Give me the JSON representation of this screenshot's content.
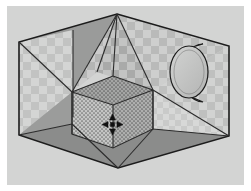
{
  "viewport": {
    "name": "3d-modeling-viewport",
    "canvas_background": "#d3d4d3",
    "page_background": "#ffffff",
    "outline_color": "#1c1c1c",
    "width": 251,
    "height": 191
  },
  "cursor": {
    "icon": "move-four-arrow-cursor",
    "x": 112,
    "y": 124,
    "color": "#111111"
  },
  "scene": {
    "label": "open-box-room-with-inner-cube-and-cylinder",
    "outer_shell": {
      "name": "outer-box-shell",
      "shape": "hexagonal-outline",
      "points": "117,14 229,46 229,136 118,168 19,135 19,42"
    },
    "faces": [
      {
        "name": "face-left-wall-checkered",
        "fill": "#c2c3c2",
        "points": "19,42 73,30 73,117 19,135",
        "texture": "checkerboard"
      },
      {
        "name": "face-left-wall-upper-checkered",
        "fill": "#bcbdbc",
        "points": "19,42 117,14 117,45 19,75",
        "texture": "checkerboard"
      },
      {
        "name": "face-ceiling-left-panel",
        "fill": "#9a9b9a",
        "points": "117,14 19,42 72,92",
        "texture": "none"
      },
      {
        "name": "face-ceiling-center-left",
        "fill": "#b4b5b4",
        "points": "117,14 72,92 97,72",
        "texture": "checkerboard"
      },
      {
        "name": "face-ceiling-center-right",
        "fill": "#a9aaa9",
        "points": "117,14 97,72 153,90",
        "texture": "checkerboard"
      },
      {
        "name": "face-ceiling-right-panel",
        "fill": "#b9bab9",
        "points": "117,14 153,90 229,46",
        "texture": "checkerboard"
      },
      {
        "name": "face-right-wall-upper",
        "fill": "#bfc0bf",
        "points": "229,46 153,90 229,136",
        "texture": "checkerboard"
      },
      {
        "name": "face-right-wall-lower",
        "fill": "#c9cac9",
        "points": "153,90 229,136 153,129",
        "texture": "checkerboard"
      },
      {
        "name": "face-floor-dark",
        "fill": "#8b8c8b",
        "points": "19,135 118,168 229,136 153,129 72,124",
        "texture": "none"
      },
      {
        "name": "face-floor-left-wedge",
        "fill": "#9b9c9b",
        "points": "19,135 72,124 72,92",
        "texture": "none"
      }
    ],
    "inner_cube": {
      "name": "inner-cube",
      "texture": "stipple-dots",
      "top_face": {
        "name": "cube-top-face",
        "fill": "#a5a6a5",
        "points": "72,92 113,76 153,90 113,105"
      },
      "left_face": {
        "name": "cube-left-face",
        "fill": "#c4c5c4",
        "points": "72,92 113,105 113,148 72,134"
      },
      "right_face": {
        "name": "cube-right-face",
        "fill": "#aeafae",
        "points": "113,105 153,90 153,129 113,148"
      }
    },
    "cylinder": {
      "name": "cylinder-primitive",
      "fill_cap": "#c6c7c6",
      "fill_body": "#a8a9a8",
      "cap_center_x": 196,
      "cap_center_y": 70,
      "cap_rx": 19,
      "cap_ry": 26,
      "depth": 14
    }
  }
}
